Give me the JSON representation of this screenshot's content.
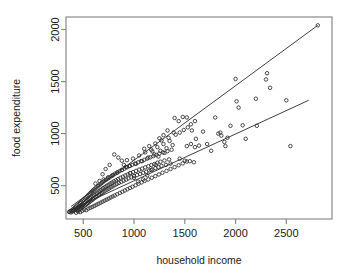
{
  "chart_data": {
    "type": "scatter",
    "title": "",
    "xlabel": "household income",
    "ylabel": "food expenditure",
    "xlim": [
      330,
      2950
    ],
    "ylim": [
      180,
      2120
    ],
    "grid": false,
    "legend": null,
    "xticks": [
      500,
      1000,
      1500,
      2000,
      2500
    ],
    "xticklabels": [
      "500",
      "1000",
      "1500",
      "2000",
      "2500"
    ],
    "yticks": [
      500,
      1000,
      1500,
      2000
    ],
    "yticklabels": [
      "500",
      "1000",
      "1500",
      "2000"
    ],
    "marker": "open-circle",
    "marker_color": "#2b2b2b",
    "line_color": "#2b2b2b",
    "axis_color": "#8a8a8a",
    "background_color": "#ffffff",
    "annotations": [],
    "reference_lines": [
      {
        "name": "upper-boundary-line",
        "x": [
          380,
          2810
        ],
        "y": [
          300,
          2040
        ]
      },
      {
        "name": "lower-boundary-line",
        "x": [
          380,
          2720
        ],
        "y": [
          268,
          1320
        ]
      }
    ],
    "points": [
      [
        360,
        248
      ],
      [
        370,
        255
      ],
      [
        378,
        243
      ],
      [
        385,
        262
      ],
      [
        392,
        250
      ],
      [
        398,
        272
      ],
      [
        404,
        258
      ],
      [
        410,
        281
      ],
      [
        415,
        265
      ],
      [
        420,
        292
      ],
      [
        424,
        272
      ],
      [
        430,
        300
      ],
      [
        434,
        281
      ],
      [
        438,
        262
      ],
      [
        443,
        310
      ],
      [
        447,
        288
      ],
      [
        452,
        268
      ],
      [
        456,
        322
      ],
      [
        460,
        296
      ],
      [
        464,
        276
      ],
      [
        468,
        334
      ],
      [
        472,
        305
      ],
      [
        476,
        284
      ],
      [
        480,
        344
      ],
      [
        484,
        313
      ],
      [
        488,
        292
      ],
      [
        492,
        356
      ],
      [
        496,
        322
      ],
      [
        500,
        300
      ],
      [
        504,
        366
      ],
      [
        508,
        331
      ],
      [
        512,
        308
      ],
      [
        516,
        378
      ],
      [
        520,
        340
      ],
      [
        524,
        316
      ],
      [
        528,
        388
      ],
      [
        532,
        350
      ],
      [
        536,
        325
      ],
      [
        540,
        400
      ],
      [
        544,
        360
      ],
      [
        548,
        334
      ],
      [
        552,
        412
      ],
      [
        556,
        370
      ],
      [
        560,
        342
      ],
      [
        564,
        424
      ],
      [
        568,
        380
      ],
      [
        572,
        352
      ],
      [
        576,
        436
      ],
      [
        580,
        390
      ],
      [
        584,
        360
      ],
      [
        588,
        448
      ],
      [
        592,
        400
      ],
      [
        596,
        370
      ],
      [
        600,
        460
      ],
      [
        605,
        412
      ],
      [
        610,
        380
      ],
      [
        615,
        472
      ],
      [
        620,
        422
      ],
      [
        625,
        390
      ],
      [
        630,
        484
      ],
      [
        635,
        432
      ],
      [
        640,
        400
      ],
      [
        645,
        496
      ],
      [
        650,
        444
      ],
      [
        655,
        410
      ],
      [
        660,
        508
      ],
      [
        665,
        454
      ],
      [
        670,
        420
      ],
      [
        675,
        520
      ],
      [
        680,
        464
      ],
      [
        685,
        430
      ],
      [
        690,
        532
      ],
      [
        695,
        476
      ],
      [
        700,
        440
      ],
      [
        706,
        544
      ],
      [
        712,
        486
      ],
      [
        718,
        452
      ],
      [
        724,
        556
      ],
      [
        730,
        498
      ],
      [
        736,
        462
      ],
      [
        742,
        568
      ],
      [
        748,
        508
      ],
      [
        754,
        472
      ],
      [
        760,
        580
      ],
      [
        766,
        520
      ],
      [
        772,
        484
      ],
      [
        778,
        592
      ],
      [
        784,
        530
      ],
      [
        790,
        494
      ],
      [
        796,
        604
      ],
      [
        802,
        542
      ],
      [
        808,
        504
      ],
      [
        815,
        616
      ],
      [
        822,
        552
      ],
      [
        829,
        516
      ],
      [
        836,
        628
      ],
      [
        843,
        564
      ],
      [
        850,
        526
      ],
      [
        858,
        640
      ],
      [
        866,
        576
      ],
      [
        874,
        536
      ],
      [
        882,
        652
      ],
      [
        890,
        586
      ],
      [
        898,
        548
      ],
      [
        906,
        664
      ],
      [
        914,
        598
      ],
      [
        922,
        558
      ],
      [
        930,
        676
      ],
      [
        938,
        608
      ],
      [
        946,
        570
      ],
      [
        955,
        688
      ],
      [
        964,
        620
      ],
      [
        973,
        580
      ],
      [
        982,
        700
      ],
      [
        991,
        630
      ],
      [
        1000,
        592
      ],
      [
        1010,
        712
      ],
      [
        1020,
        642
      ],
      [
        1030,
        602
      ],
      [
        1040,
        724
      ],
      [
        1050,
        654
      ],
      [
        1060,
        612
      ],
      [
        1070,
        736
      ],
      [
        1080,
        664
      ],
      [
        1090,
        624
      ],
      [
        1100,
        748
      ],
      [
        1110,
        676
      ],
      [
        1120,
        634
      ],
      [
        1130,
        760
      ],
      [
        1140,
        686
      ],
      [
        1150,
        646
      ],
      [
        1160,
        772
      ],
      [
        1170,
        698
      ],
      [
        1180,
        656
      ],
      [
        1190,
        784
      ],
      [
        1200,
        708
      ],
      [
        1210,
        668
      ],
      [
        1220,
        796
      ],
      [
        1230,
        720
      ],
      [
        1240,
        678
      ],
      [
        1250,
        808
      ],
      [
        1260,
        730
      ],
      [
        1270,
        690
      ],
      [
        1285,
        820
      ],
      [
        1300,
        742
      ],
      [
        1315,
        700
      ],
      [
        1330,
        832
      ],
      [
        1345,
        752
      ],
      [
        1360,
        712
      ],
      [
        430,
        240
      ],
      [
        450,
        252
      ],
      [
        470,
        246
      ],
      [
        490,
        258
      ],
      [
        510,
        270
      ],
      [
        530,
        264
      ],
      [
        550,
        280
      ],
      [
        570,
        288
      ],
      [
        590,
        296
      ],
      [
        610,
        306
      ],
      [
        630,
        316
      ],
      [
        650,
        326
      ],
      [
        670,
        336
      ],
      [
        690,
        346
      ],
      [
        710,
        356
      ],
      [
        730,
        366
      ],
      [
        750,
        376
      ],
      [
        770,
        386
      ],
      [
        790,
        396
      ],
      [
        810,
        406
      ],
      [
        835,
        418
      ],
      [
        860,
        430
      ],
      [
        885,
        442
      ],
      [
        910,
        454
      ],
      [
        935,
        466
      ],
      [
        960,
        478
      ],
      [
        985,
        490
      ],
      [
        1015,
        504
      ],
      [
        1045,
        518
      ],
      [
        1075,
        532
      ],
      [
        1105,
        546
      ],
      [
        1140,
        560
      ],
      [
        1175,
        576
      ],
      [
        1210,
        592
      ],
      [
        1245,
        608
      ],
      [
        1280,
        624
      ],
      [
        1320,
        642
      ],
      [
        1360,
        660
      ],
      [
        1400,
        678
      ],
      [
        1440,
        696
      ],
      [
        1480,
        714
      ],
      [
        1520,
        732
      ],
      [
        620,
        520
      ],
      [
        660,
        545
      ],
      [
        700,
        560
      ],
      [
        745,
        580
      ],
      [
        790,
        600
      ],
      [
        835,
        625
      ],
      [
        880,
        650
      ],
      [
        900,
        700
      ],
      [
        930,
        745
      ],
      [
        960,
        690
      ],
      [
        990,
        760
      ],
      [
        1020,
        710
      ],
      [
        1050,
        790
      ],
      [
        1080,
        735
      ],
      [
        1110,
        820
      ],
      [
        1140,
        770
      ],
      [
        1170,
        845
      ],
      [
        1200,
        800
      ],
      [
        1230,
        870
      ],
      [
        1260,
        835
      ],
      [
        1290,
        900
      ],
      [
        1320,
        860
      ],
      [
        1350,
        930
      ],
      [
        1380,
        890
      ],
      [
        1100,
        855
      ],
      [
        1150,
        880
      ],
      [
        1180,
        830
      ],
      [
        1210,
        905
      ],
      [
        1240,
        780
      ],
      [
        1270,
        935
      ],
      [
        1300,
        815
      ],
      [
        1340,
        960
      ],
      [
        1370,
        845
      ],
      [
        1410,
        990
      ],
      [
        1450,
        1010
      ],
      [
        1490,
        1035
      ],
      [
        1530,
        1060
      ],
      [
        1400,
        1150
      ],
      [
        1440,
        1120
      ],
      [
        1480,
        1160
      ],
      [
        1520,
        1155
      ],
      [
        1560,
        1090
      ],
      [
        1570,
        1030
      ],
      [
        1600,
        1120
      ],
      [
        1610,
        950
      ],
      [
        1520,
        880
      ],
      [
        1560,
        900
      ],
      [
        1600,
        870
      ],
      [
        1640,
        885
      ],
      [
        1450,
        760
      ],
      [
        1500,
        740
      ],
      [
        1550,
        735
      ],
      [
        1590,
        725
      ],
      [
        1800,
        1155
      ],
      [
        1830,
        1000
      ],
      [
        1860,
        980
      ],
      [
        1890,
        920
      ],
      [
        1900,
        880
      ],
      [
        1920,
        960
      ],
      [
        1950,
        1075
      ],
      [
        2000,
        1525
      ],
      [
        2010,
        1310
      ],
      [
        2030,
        1250
      ],
      [
        2070,
        1080
      ],
      [
        2100,
        950
      ],
      [
        2200,
        1335
      ],
      [
        2210,
        1075
      ],
      [
        2300,
        1520
      ],
      [
        2310,
        1580
      ],
      [
        2340,
        1440
      ],
      [
        2500,
        1320
      ],
      [
        2540,
        880
      ],
      [
        2810,
        2040
      ],
      [
        1680,
        1020
      ],
      [
        1720,
        900
      ],
      [
        1760,
        835
      ],
      [
        1850,
        1010
      ],
      [
        1390,
        1010
      ],
      [
        1330,
        1030
      ],
      [
        1290,
        985
      ],
      [
        1250,
        955
      ],
      [
        880,
        740
      ],
      [
        920,
        680
      ],
      [
        960,
        620
      ],
      [
        1000,
        575
      ],
      [
        1040,
        540
      ],
      [
        1090,
        560
      ],
      [
        1130,
        600
      ],
      [
        1170,
        650
      ],
      [
        1215,
        700
      ],
      [
        805,
        800
      ],
      [
        845,
        770
      ],
      [
        760,
        700
      ],
      [
        720,
        660
      ],
      [
        690,
        610
      ]
    ]
  }
}
